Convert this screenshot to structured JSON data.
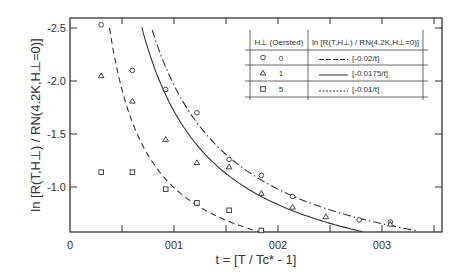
{
  "chart_data": {
    "type": "scatter",
    "title": "",
    "xlabel": "t = [T / Tc* - 1]",
    "ylabel": "ln [R(T,H⊥) / RN(4.2K,H⊥=0)]",
    "xlim": [
      0,
      0.0358
    ],
    "ylim": [
      -0.58,
      -2.6
    ],
    "y_reversed": true,
    "x_ticks": [
      {
        "value": 0,
        "label": "0"
      },
      {
        "value": 0.005,
        "label": ""
      },
      {
        "value": 0.01,
        "label": "001"
      },
      {
        "value": 0.015,
        "label": ""
      },
      {
        "value": 0.02,
        "label": "002"
      },
      {
        "value": 0.025,
        "label": ""
      },
      {
        "value": 0.03,
        "label": "003"
      },
      {
        "value": 0.035,
        "label": ""
      }
    ],
    "y_ticks": [
      {
        "value": -2.5,
        "label": "-2.5"
      },
      {
        "value": -2.0,
        "label": "-2.0"
      },
      {
        "value": -1.5,
        "label": "-1.5"
      },
      {
        "value": -1.0,
        "label": "-1.0"
      }
    ],
    "grid": false,
    "series": [
      {
        "name": "H⊥ = 0 Oersted",
        "marker": "circle",
        "points": [
          [
            0.003,
            -2.53
          ],
          [
            0.006,
            -2.1
          ],
          [
            0.0092,
            -1.92
          ],
          [
            0.0122,
            -1.7
          ],
          [
            0.0153,
            -1.26
          ],
          [
            0.0184,
            -1.11
          ],
          [
            0.0214,
            -0.91
          ],
          [
            0.0278,
            -0.69
          ],
          [
            0.0308,
            -0.67
          ]
        ]
      },
      {
        "name": "H⊥ = 1 Oersted",
        "marker": "triangle",
        "points": [
          [
            0.003,
            -2.05
          ],
          [
            0.006,
            -1.81
          ],
          [
            0.0092,
            -1.45
          ],
          [
            0.0122,
            -1.23
          ],
          [
            0.0153,
            -1.19
          ],
          [
            0.0184,
            -0.94
          ],
          [
            0.0214,
            -0.81
          ],
          [
            0.0246,
            -0.72
          ],
          [
            0.0308,
            -0.65
          ]
        ]
      },
      {
        "name": "H⊥ = 5 Oersted",
        "marker": "square",
        "points": [
          [
            0.003,
            -1.14
          ],
          [
            0.006,
            -1.14
          ],
          [
            0.0092,
            -0.98
          ],
          [
            0.0122,
            -0.85
          ],
          [
            0.0153,
            -0.78
          ],
          [
            0.0184,
            -0.59
          ]
        ]
      }
    ],
    "fits": [
      {
        "name": "[-0.02/t]",
        "style": "dash-dot",
        "a": 0.0196,
        "b": 0.0,
        "t_range": [
          0.0079,
          0.0333
        ]
      },
      {
        "name": "[-0.0175/t]",
        "style": "solid",
        "a": 0.01763,
        "b": -0.048,
        "t_range": [
          0.0069,
          0.0281
        ]
      },
      {
        "name": "[-0.01/t]",
        "style": "dashed",
        "a": 0.00923,
        "b": 0.071,
        "t_range": [
          0.0038,
          0.0181
        ]
      }
    ],
    "legend": {
      "placement": "top-right",
      "header_col1": "H⊥ (Oersted)",
      "header_col2": "ln [R(T,H⊥) / RN(4.2K,H⊥=0)]",
      "rows": [
        {
          "marker": "circle",
          "field": "0",
          "line_style": "dash-dot",
          "formula": "[-0.02/t]"
        },
        {
          "marker": "triangle",
          "field": "1",
          "line_style": "solid",
          "formula": "[-0.0175/t]"
        },
        {
          "marker": "square",
          "field": "5",
          "line_style": "dashed",
          "formula": "[-0.01/t]"
        }
      ]
    }
  }
}
